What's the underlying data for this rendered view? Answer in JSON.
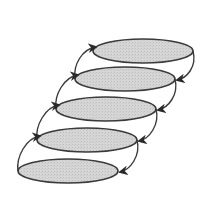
{
  "diagram": {
    "type": "stacked-ellipses-cycle",
    "background": "#ffffff",
    "fill": "#d4d4d4",
    "stroke": "#3a3a3a",
    "layers": [
      {
        "id": "layer-1",
        "cx": 143,
        "cy": 51,
        "rx": 50,
        "ry": 12
      },
      {
        "id": "layer-2",
        "cx": 125,
        "cy": 79,
        "rx": 50,
        "ry": 12
      },
      {
        "id": "layer-3",
        "cx": 106,
        "cy": 109,
        "rx": 50,
        "ry": 12
      },
      {
        "id": "layer-4",
        "cx": 87,
        "cy": 140,
        "rx": 50,
        "ry": 12
      },
      {
        "id": "layer-5",
        "cx": 68,
        "cy": 171,
        "rx": 50,
        "ry": 12
      }
    ],
    "arrows": {
      "left_side": "upward, from lower layer's left edge to upper layer's left top",
      "right_side": "downward, from upper layer's right edge to lower layer's right edge"
    }
  }
}
